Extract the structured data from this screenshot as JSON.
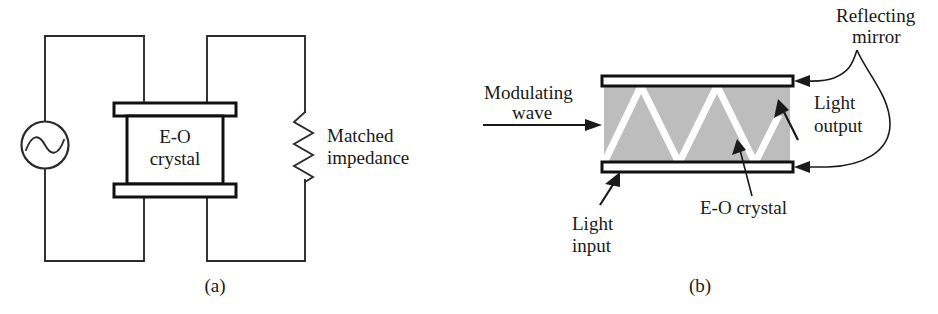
{
  "figure": {
    "panels": [
      {
        "id": "a",
        "caption": "(a)",
        "labels": {
          "crystal_line1": "E-O",
          "crystal_line2": "crystal",
          "impedance_line1": "Matched",
          "impedance_line2": "impedance"
        },
        "components": [
          "ac-source",
          "electrode-plate-top",
          "electrode-plate-bottom",
          "eo-crystal-box",
          "resistor-matched-impedance"
        ]
      },
      {
        "id": "b",
        "caption": "(b)",
        "labels": {
          "modulating_line1": "Modulating",
          "modulating_line2": "wave",
          "reflecting_line1": "Reflecting",
          "reflecting_line2": "mirror",
          "light_output_line1": "Light",
          "light_output_line2": "output",
          "light_input_line1": "Light",
          "light_input_line2": "input",
          "eo_crystal": "E-O  crystal"
        },
        "components": [
          "reflecting-mirror-top",
          "reflecting-mirror-bottom",
          "eo-crystal-shaded-region",
          "zigzag-light-beam",
          "modulating-wave-arrow"
        ]
      }
    ],
    "colors": {
      "ink": "#1a1a1a",
      "line": "#2b2b2b",
      "crystal_shade": "#bdbdbd",
      "beam": "#ffffff",
      "background": "#ffffff"
    }
  }
}
